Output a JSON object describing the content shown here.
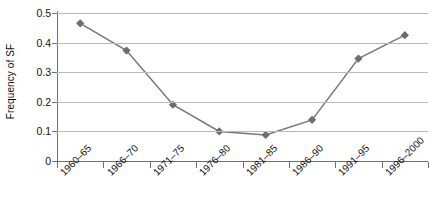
{
  "chart_data": {
    "type": "line",
    "title": "",
    "xlabel": "",
    "ylabel": "Frequency of SF",
    "categories": [
      "1960–65",
      "1966–70",
      "1971–75",
      "1976–80",
      "1981–85",
      "1986–90",
      "1991–95",
      "1996–2000"
    ],
    "values": [
      0.465,
      0.373,
      0.19,
      0.1,
      0.088,
      0.139,
      0.346,
      0.425
    ],
    "series": [
      {
        "name": "Frequency of SF",
        "values": [
          0.465,
          0.373,
          0.19,
          0.1,
          0.088,
          0.139,
          0.346,
          0.425
        ]
      }
    ],
    "ylim": [
      0,
      0.5
    ],
    "y_ticks": [
      0,
      0.1,
      0.2,
      0.3,
      0.4,
      0.5
    ],
    "y_tick_labels": [
      "0",
      "0.1",
      "0.2",
      "0.3",
      "0.4",
      "0.5"
    ],
    "grid": "horizontal",
    "legend": "none",
    "marker": "diamond",
    "line_color": "#777777",
    "marker_color": "#6e6e6e",
    "gridline_color": "#b9b9b9",
    "axis_color": "#6f6f6f",
    "text_color": "#111111"
  }
}
